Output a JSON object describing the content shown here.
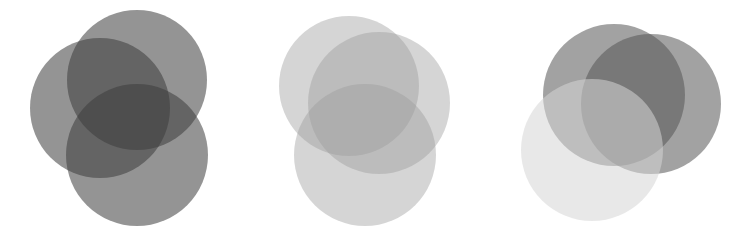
{
  "figure": {
    "width": 742,
    "height": 242,
    "background": "#ffffff",
    "groups": [
      {
        "name": "dark-venn",
        "circles": [
          {
            "cx": 100,
            "cy": 108,
            "r": 70,
            "fill": "#3c3c3c",
            "opacity": 0.55
          },
          {
            "cx": 137,
            "cy": 80,
            "r": 70,
            "fill": "#3c3c3c",
            "opacity": 0.55
          },
          {
            "cx": 137,
            "cy": 155,
            "r": 71,
            "fill": "#3c3c3c",
            "opacity": 0.55
          }
        ]
      },
      {
        "name": "light-venn",
        "circles": [
          {
            "cx": 349,
            "cy": 86,
            "r": 70,
            "fill": "#9a9a9a",
            "opacity": 0.42
          },
          {
            "cx": 379,
            "cy": 103,
            "r": 71,
            "fill": "#9a9a9a",
            "opacity": 0.42
          },
          {
            "cx": 365,
            "cy": 155,
            "r": 71,
            "fill": "#9a9a9a",
            "opacity": 0.42
          }
        ]
      },
      {
        "name": "mixed-venn",
        "circles": [
          {
            "cx": 614,
            "cy": 95,
            "r": 71,
            "fill": "#555555",
            "opacity": 0.55
          },
          {
            "cx": 651,
            "cy": 104,
            "r": 70,
            "fill": "#555555",
            "opacity": 0.55
          },
          {
            "cx": 592,
            "cy": 150,
            "r": 71,
            "fill": "#d6d6d6",
            "opacity": 0.55
          }
        ]
      }
    ]
  }
}
